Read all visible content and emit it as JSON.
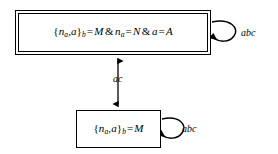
{
  "diagram": {
    "type": "state-transition-diagram",
    "background_color": "#ffffff",
    "stroke_color": "#000000",
    "nodes": [
      {
        "id": "accepting-state",
        "style": "double-border",
        "formula_plain": "{n_a,a}_b = M & n_a = N & a = A",
        "parts": {
          "brace_open": "{",
          "n": "n",
          "n_sub": "a",
          "comma": ",",
          "a": "a",
          "brace_close": "}",
          "brace_sub": "b",
          "eq1": "=",
          "M": "M",
          "amp1": "&",
          "n2": "n",
          "n2_sub": "a",
          "eq2": "=",
          "N": "N",
          "amp2": "&",
          "a2": "a",
          "eq3": "=",
          "A": "A"
        }
      },
      {
        "id": "plain-state",
        "style": "single-border",
        "formula_plain": "{n_a,a}_b = M",
        "parts": {
          "brace_open": "{",
          "n": "n",
          "n_sub": "a",
          "comma": ",",
          "a": "a",
          "brace_close": "}",
          "brace_sub": "b",
          "eq1": "=",
          "M": "M"
        }
      }
    ],
    "edges": [
      {
        "id": "transition-vertical",
        "label": "ac",
        "kind": "double-headed-vertical",
        "from": "plain-state",
        "to": "accepting-state"
      },
      {
        "id": "self-loop-accepting",
        "label": "abc",
        "kind": "self-loop",
        "on": "accepting-state"
      },
      {
        "id": "self-loop-plain",
        "label": "abc",
        "kind": "self-loop",
        "on": "plain-state"
      }
    ]
  }
}
